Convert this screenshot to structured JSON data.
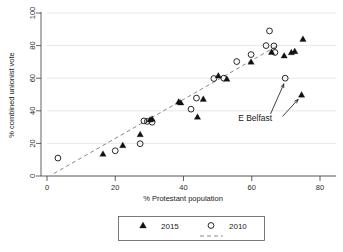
{
  "chart_data": {
    "type": "scatter",
    "title": "",
    "xlabel": "% Protestant population",
    "ylabel": "% combined unionist vote",
    "xlim": [
      0,
      80
    ],
    "ylim": [
      0,
      100
    ],
    "xticks": [
      0,
      20,
      40,
      60,
      80
    ],
    "yticks": [
      0,
      20,
      40,
      60,
      80,
      100
    ],
    "xtick_labels": [
      "0",
      "20",
      "40",
      "60",
      "80"
    ],
    "ytick_labels": [
      "0",
      "20",
      "40",
      "60",
      "80",
      "100"
    ],
    "grid": "horizontal",
    "legend_position": "below-plot",
    "series": [
      {
        "name": "2015",
        "marker": "filled-triangle",
        "color": "#111111",
        "points": [
          {
            "x": 16.4,
            "y": 13.5
          },
          {
            "x": 22.2,
            "y": 18.8
          },
          {
            "x": 27.3,
            "y": 25.5
          },
          {
            "x": 30.2,
            "y": 34.5
          },
          {
            "x": 30.8,
            "y": 35.0
          },
          {
            "x": 38.6,
            "y": 45.5
          },
          {
            "x": 39.2,
            "y": 45.0
          },
          {
            "x": 44.1,
            "y": 36.2
          },
          {
            "x": 45.8,
            "y": 47.2
          },
          {
            "x": 50.2,
            "y": 61.5
          },
          {
            "x": 52.7,
            "y": 59.5
          },
          {
            "x": 59.8,
            "y": 70.0
          },
          {
            "x": 65.8,
            "y": 76.0
          },
          {
            "x": 69.5,
            "y": 73.8
          },
          {
            "x": 71.6,
            "y": 75.8
          },
          {
            "x": 72.6,
            "y": 76.5
          },
          {
            "x": 74.6,
            "y": 49.8
          },
          {
            "x": 75.0,
            "y": 84.0
          }
        ]
      },
      {
        "name": "2010",
        "marker": "open-circle",
        "color": "#111111",
        "points": [
          {
            "x": 3.2,
            "y": 11.0
          },
          {
            "x": 20.0,
            "y": 15.5
          },
          {
            "x": 27.3,
            "y": 19.8
          },
          {
            "x": 28.4,
            "y": 33.8
          },
          {
            "x": 29.4,
            "y": 33.5
          },
          {
            "x": 30.8,
            "y": 33.0
          },
          {
            "x": 42.2,
            "y": 41.0
          },
          {
            "x": 43.8,
            "y": 47.8
          },
          {
            "x": 48.9,
            "y": 59.8
          },
          {
            "x": 51.8,
            "y": 60.0
          },
          {
            "x": 55.6,
            "y": 70.2
          },
          {
            "x": 59.8,
            "y": 74.5
          },
          {
            "x": 64.2,
            "y": 80.0
          },
          {
            "x": 65.2,
            "y": 89.0
          },
          {
            "x": 66.5,
            "y": 79.8
          },
          {
            "x": 66.8,
            "y": 75.8
          },
          {
            "x": 69.8,
            "y": 60.0
          }
        ]
      }
    ],
    "fit_line": {
      "name": "fitted values",
      "style": "dashed",
      "color": "#8a8a8a",
      "x_start": 2.0,
      "y_start": 1.5,
      "x_end": 68.0,
      "y_end": 80.5
    },
    "annotations": [
      {
        "label": "E Belfast",
        "label_x": 61.0,
        "label_y": 33.5,
        "arrows": [
          {
            "from_x": 65.5,
            "from_y": 38.0,
            "to_x": 69.4,
            "to_y": 56.5
          },
          {
            "from_x": 69.0,
            "from_y": 36.5,
            "to_x": 73.6,
            "to_y": 47.0
          }
        ]
      }
    ],
    "legend": {
      "entries": [
        {
          "label": "2015",
          "marker": "filled-triangle"
        },
        {
          "label": "2010",
          "marker": "open-circle"
        },
        {
          "label": "",
          "marker": "dashed-line"
        }
      ]
    }
  }
}
